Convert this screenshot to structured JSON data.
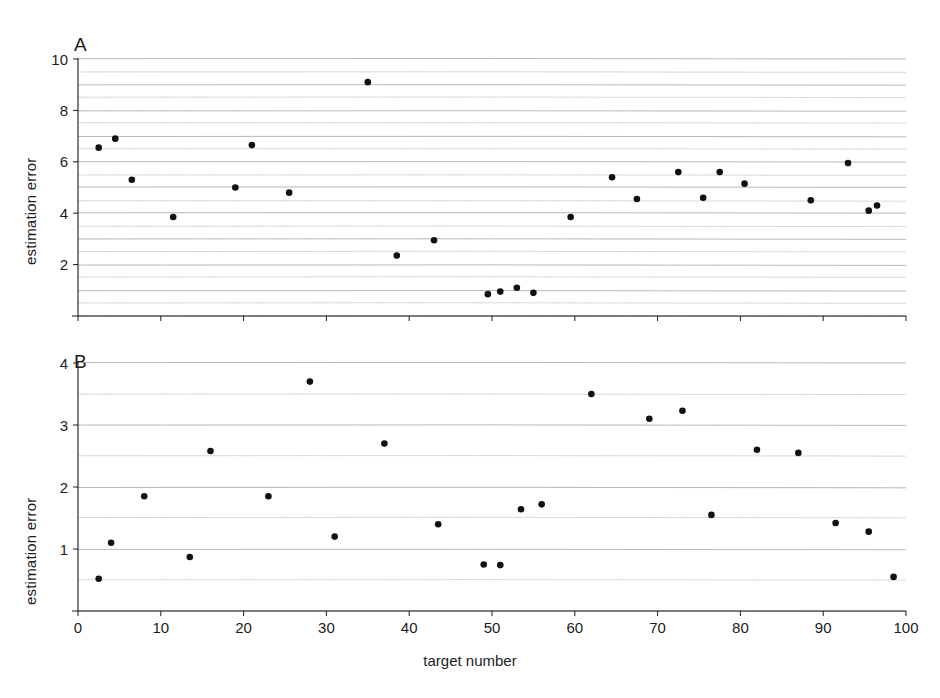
{
  "figure": {
    "width": 940,
    "height": 698,
    "background": "#ffffff",
    "ink_color": "#1c1c1c",
    "grid_color": "#9a9a9a",
    "marker_color": "#111111"
  },
  "panels": [
    {
      "letter": "A",
      "ylabel": "estimation error",
      "ytick_labels": [
        "10",
        "8",
        "6",
        "4",
        "2"
      ]
    },
    {
      "letter": "B",
      "ylabel": "estimation error",
      "ytick_labels": [
        "4",
        "3",
        "2",
        "1"
      ]
    }
  ],
  "xaxis": {
    "label": "target number",
    "tick_labels": [
      "0",
      "10",
      "20",
      "30",
      "40",
      "50",
      "60",
      "70",
      "80",
      "90",
      "100"
    ]
  },
  "chart_data": [
    {
      "type": "scatter",
      "panel": "A",
      "title": "A",
      "xlabel": "target number",
      "ylabel": "estimation error",
      "xlim": [
        0,
        100
      ],
      "ylim": [
        0,
        10
      ],
      "xticks": [
        0,
        10,
        20,
        30,
        40,
        50,
        60,
        70,
        80,
        90,
        100
      ],
      "yticks": [
        2,
        4,
        6,
        8,
        10
      ],
      "grid": true,
      "grid_interval": 0.5,
      "legend": "none",
      "points": [
        {
          "x": 2.5,
          "y": 6.55
        },
        {
          "x": 4.5,
          "y": 6.9
        },
        {
          "x": 6.5,
          "y": 5.3
        },
        {
          "x": 11.5,
          "y": 3.85
        },
        {
          "x": 19.0,
          "y": 5.0
        },
        {
          "x": 21.0,
          "y": 6.65
        },
        {
          "x": 25.5,
          "y": 4.8
        },
        {
          "x": 35.0,
          "y": 9.1
        },
        {
          "x": 38.5,
          "y": 2.35
        },
        {
          "x": 43.0,
          "y": 2.95
        },
        {
          "x": 49.5,
          "y": 0.85
        },
        {
          "x": 51.0,
          "y": 0.95
        },
        {
          "x": 53.0,
          "y": 1.1
        },
        {
          "x": 55.0,
          "y": 0.9
        },
        {
          "x": 59.5,
          "y": 3.85
        },
        {
          "x": 64.5,
          "y": 5.4
        },
        {
          "x": 67.5,
          "y": 4.55
        },
        {
          "x": 72.5,
          "y": 5.6
        },
        {
          "x": 75.5,
          "y": 4.6
        },
        {
          "x": 77.5,
          "y": 5.6
        },
        {
          "x": 80.5,
          "y": 5.15
        },
        {
          "x": 88.5,
          "y": 4.5
        },
        {
          "x": 93.0,
          "y": 5.95
        },
        {
          "x": 95.5,
          "y": 4.1
        },
        {
          "x": 96.5,
          "y": 4.3
        }
      ]
    },
    {
      "type": "scatter",
      "panel": "B",
      "title": "B",
      "xlabel": "target number",
      "ylabel": "estimation error",
      "xlim": [
        0,
        100
      ],
      "ylim": [
        0,
        4
      ],
      "xticks": [
        0,
        10,
        20,
        30,
        40,
        50,
        60,
        70,
        80,
        90,
        100
      ],
      "yticks": [
        1,
        2,
        3,
        4
      ],
      "grid": true,
      "grid_interval": 0.5,
      "legend": "none",
      "points": [
        {
          "x": 2.5,
          "y": 0.52
        },
        {
          "x": 4.0,
          "y": 1.1
        },
        {
          "x": 8.0,
          "y": 1.85
        },
        {
          "x": 13.5,
          "y": 0.87
        },
        {
          "x": 16.0,
          "y": 2.58
        },
        {
          "x": 23.0,
          "y": 1.85
        },
        {
          "x": 28.0,
          "y": 3.7
        },
        {
          "x": 31.0,
          "y": 1.2
        },
        {
          "x": 37.0,
          "y": 2.7
        },
        {
          "x": 43.5,
          "y": 1.4
        },
        {
          "x": 49.0,
          "y": 0.75
        },
        {
          "x": 51.0,
          "y": 0.74
        },
        {
          "x": 53.5,
          "y": 1.64
        },
        {
          "x": 56.0,
          "y": 1.72
        },
        {
          "x": 62.0,
          "y": 3.5
        },
        {
          "x": 69.0,
          "y": 3.1
        },
        {
          "x": 73.0,
          "y": 3.23
        },
        {
          "x": 76.5,
          "y": 1.55
        },
        {
          "x": 82.0,
          "y": 2.6
        },
        {
          "x": 87.0,
          "y": 2.55
        },
        {
          "x": 91.5,
          "y": 1.42
        },
        {
          "x": 95.5,
          "y": 1.28
        },
        {
          "x": 98.5,
          "y": 0.55
        }
      ]
    }
  ]
}
